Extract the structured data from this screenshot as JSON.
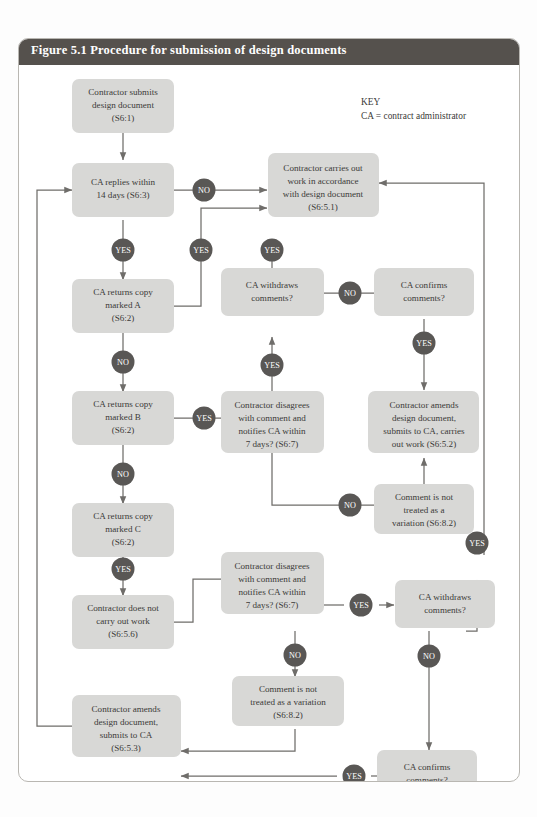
{
  "figure": {
    "title": "Figure 5.1  Procedure for submission of design documents",
    "header_color": "#55514d",
    "box_color": "#d8d8d6",
    "badge_color": "#595755",
    "connector_color": "#6f6d6a"
  },
  "key": {
    "heading": "KEY",
    "line": "CA = contract administrator"
  },
  "nodes": [
    {
      "id": "n1",
      "lines": [
        "Contractor submits",
        "design document",
        "(S6:1)"
      ]
    },
    {
      "id": "n2",
      "lines": [
        "CA replies within",
        "14 days (S6:3)"
      ]
    },
    {
      "id": "n3",
      "lines": [
        "CA returns copy",
        "marked A",
        "(S6:2)"
      ]
    },
    {
      "id": "n4",
      "lines": [
        "CA returns copy",
        "marked B",
        "(S6:2)"
      ]
    },
    {
      "id": "n5",
      "lines": [
        "CA returns copy",
        "marked C",
        "(S6:2)"
      ]
    },
    {
      "id": "n6",
      "lines": [
        "Contractor does not",
        "carry out work",
        "(S6:5.6)"
      ]
    },
    {
      "id": "n7",
      "lines": [
        "Contractor amends",
        "design document,",
        "submits to CA",
        "(S6:5.3)"
      ]
    },
    {
      "id": "n8",
      "lines": [
        "Contractor carries out",
        "work in accordance",
        "with design document",
        "(S6:5.1)"
      ]
    },
    {
      "id": "n9",
      "lines": [
        "CA withdraws",
        "comments?"
      ]
    },
    {
      "id": "n10",
      "lines": [
        "CA confirms",
        "comments?"
      ]
    },
    {
      "id": "n11",
      "lines": [
        "Contractor disagrees",
        "with comment and",
        "notifies CA within",
        "7 days? (S6:7)"
      ]
    },
    {
      "id": "n12",
      "lines": [
        "Contractor amends",
        "design document,",
        "submits to CA, carries",
        "out work (S6:5.2)"
      ]
    },
    {
      "id": "n13",
      "lines": [
        "Comment is not",
        "treated as a",
        "variation (S6:8.2)"
      ]
    },
    {
      "id": "n14",
      "lines": [
        "Contractor disagrees",
        "with comment and",
        "notifies CA within",
        "7 days? (S6:7)"
      ]
    },
    {
      "id": "n15",
      "lines": [
        "CA withdraws",
        "comments?"
      ]
    },
    {
      "id": "n16",
      "lines": [
        "Comment is not",
        "treated as a variation",
        "(S6:8.2)"
      ]
    },
    {
      "id": "n17",
      "lines": [
        "CA confirms",
        "comments?"
      ]
    }
  ],
  "badges": [
    {
      "id": "b1",
      "label": "NO"
    },
    {
      "id": "b2",
      "label": "YES"
    },
    {
      "id": "b3",
      "label": "YES"
    },
    {
      "id": "b4",
      "label": "NO"
    },
    {
      "id": "b5",
      "label": "YES"
    },
    {
      "id": "b6",
      "label": "NO"
    },
    {
      "id": "b7",
      "label": "YES"
    },
    {
      "id": "b8",
      "label": "YES"
    },
    {
      "id": "b9",
      "label": "NO"
    },
    {
      "id": "b10",
      "label": "YES"
    },
    {
      "id": "b11",
      "label": "YES"
    },
    {
      "id": "b12",
      "label": "NO"
    },
    {
      "id": "b13",
      "label": "YES"
    },
    {
      "id": "b14",
      "label": "YES"
    },
    {
      "id": "b15",
      "label": "NO"
    },
    {
      "id": "b16",
      "label": "NO"
    },
    {
      "id": "b17",
      "label": "YES"
    }
  ]
}
